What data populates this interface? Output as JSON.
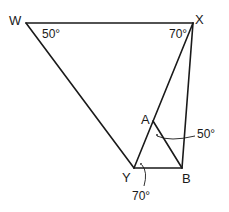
{
  "diagram": {
    "type": "geometry",
    "points": [
      {
        "name": "W",
        "x": 26,
        "y": 23
      },
      {
        "name": "X",
        "x": 193,
        "y": 23
      },
      {
        "name": "Y",
        "x": 134,
        "y": 168
      },
      {
        "name": "B",
        "x": 182,
        "y": 168
      },
      {
        "name": "A",
        "x": 153,
        "y": 121
      }
    ],
    "labels": {
      "W": "W",
      "X": "X",
      "Y": "Y",
      "B": "B",
      "A": "A"
    },
    "segments": [
      [
        "W",
        "X"
      ],
      [
        "W",
        "Y"
      ],
      [
        "X",
        "B"
      ],
      [
        "X",
        "Y"
      ],
      [
        "Y",
        "B"
      ],
      [
        "A",
        "B"
      ]
    ],
    "angles": {
      "angle_W": "50°",
      "angle_X": "70°",
      "angle_A": "50°",
      "angle_Y": "70°"
    }
  }
}
